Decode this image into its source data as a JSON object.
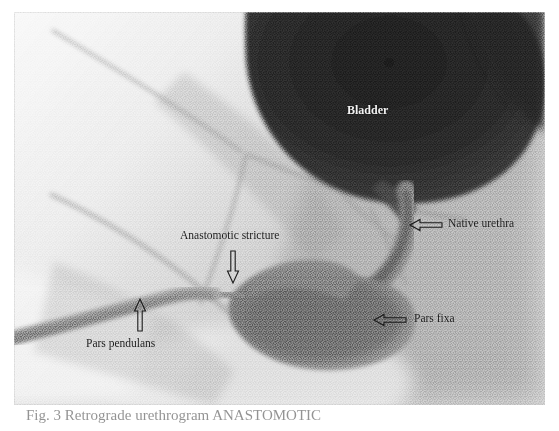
{
  "figure": {
    "type": "radiograph",
    "modality": "retrograde urethrogram",
    "caption_partial": "Fig. 3   Retrograde urethrogram    ANASTOMOTIC"
  },
  "labels": [
    {
      "id": "bladder",
      "text": "Bladder",
      "style": "light",
      "x": 347,
      "y": 104,
      "has_arrow": false
    },
    {
      "id": "native-urethra",
      "text": "Native urethra",
      "style": "dark",
      "x": 443,
      "y": 218,
      "has_arrow": true,
      "arrow_direction": "left"
    },
    {
      "id": "anastomotic-stricture",
      "text": "Anastomotic stricture",
      "style": "dark",
      "x": 180,
      "y": 230,
      "has_arrow": true,
      "arrow_direction": "down"
    },
    {
      "id": "pars-fixa",
      "text": "Pars fixa",
      "style": "dark",
      "x": 410,
      "y": 313,
      "has_arrow": true,
      "arrow_direction": "left"
    },
    {
      "id": "pars-pendulans",
      "text": "Pars pendulans",
      "style": "dark",
      "x": 86,
      "y": 338,
      "has_arrow": true,
      "arrow_direction": "up"
    }
  ],
  "colors": {
    "film_background": "#d9d9d9",
    "bladder_dark": "#2d2d2d",
    "contrast_mid": "#8f8f8f",
    "page_background": "#ffffff",
    "annotation_dark": "#1a1a1a",
    "annotation_light": "#f2f2f2"
  }
}
